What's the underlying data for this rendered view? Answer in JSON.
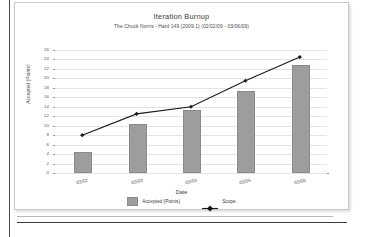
{
  "document": {
    "frame_color": "#c8c8c8",
    "page_background": "#ffffff"
  },
  "chart_data": {
    "type": "bar",
    "title": "Iteration Burnup",
    "subtitle": "The Chuck Norris - Hard 149 (2009.1) (02/02/09 - 03/06/09)",
    "xlabel": "Date",
    "ylabel": "Accepted (Points)",
    "categories": [
      "03/02",
      "03/03",
      "03/04",
      "03/05",
      "03/06"
    ],
    "ylim": [
      0,
      26
    ],
    "ytick_step": 2,
    "yticks": [
      0,
      2,
      4,
      6,
      8,
      10,
      12,
      14,
      16,
      18,
      20,
      22,
      24,
      26
    ],
    "grid": true,
    "legend_position": "bottom",
    "series": [
      {
        "name": "Accepted (Points)",
        "type": "bar",
        "color": "#9d9d9d",
        "values": [
          4,
          10,
          13,
          17,
          22.5
        ]
      },
      {
        "name": "Scope",
        "type": "line",
        "color": "#1a1a1a",
        "marker": "diamond",
        "values": [
          8,
          12.5,
          14,
          19.5,
          24.5
        ]
      }
    ]
  },
  "legend": {
    "items": [
      {
        "label": "Accepted (Points)",
        "marker": "bar-swatch"
      },
      {
        "label": "Scope",
        "marker": "line-diamond"
      }
    ]
  }
}
